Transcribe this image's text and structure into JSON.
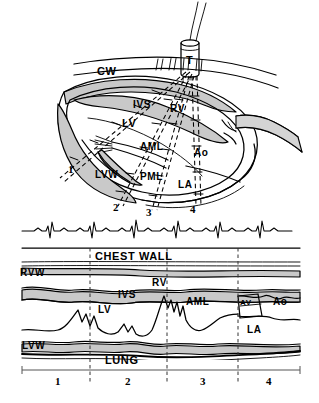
{
  "figure": {
    "type": "medical-illustration",
    "panels": [
      "anatomic-cross-section",
      "ecg-strip",
      "m-mode-echocardiogram"
    ]
  },
  "anatomy": {
    "transducer": "T",
    "chest_wall": "CW",
    "right_ventricle": "RV",
    "interventricular_septum": "IVS",
    "left_ventricle": "LV",
    "anterior_mitral_leaflet": "AML",
    "posterior_mitral_leaflet": "PML",
    "aorta": "Ao",
    "left_atrium": "LA",
    "left_ventricular_wall": "LVW"
  },
  "beam_positions": {
    "labels": [
      "1",
      "2",
      "3",
      "4"
    ],
    "count": 4
  },
  "mmode": {
    "chest_wall": "CHEST WALL",
    "right_ventricular_wall": "RVW",
    "right_ventricle": "RV",
    "interventricular_septum": "IVS",
    "left_ventricle": "LV",
    "anterior_mitral_leaflet": "AML",
    "aortic_valve": "AV",
    "aorta": "Ao",
    "left_atrium": "LA",
    "left_ventricular_wall": "LVW",
    "lung": "LUNG",
    "axis_labels": [
      "1",
      "2",
      "3",
      "4"
    ]
  },
  "ecg": {
    "name": "ECG",
    "beats": 6
  },
  "colors": {
    "ink": "#000000",
    "tissue_fill": "#c9c9c9",
    "tissue_fill_light": "#d8d8d8",
    "background": "#ffffff",
    "axis": "#444444"
  }
}
